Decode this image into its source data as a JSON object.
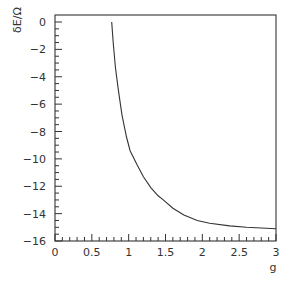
{
  "chart_data": {
    "type": "line",
    "title": "",
    "xlabel": "g",
    "ylabel": "δE/Ω",
    "xlim": [
      0,
      3
    ],
    "ylim": [
      -16,
      0.5
    ],
    "grid": false,
    "legend": null,
    "x_ticks": [
      0,
      0.5,
      1,
      1.5,
      2,
      2.5,
      3
    ],
    "x_tick_labels": [
      "0",
      "0.5",
      "1",
      "1.5",
      "2",
      "2.5",
      "3"
    ],
    "y_ticks": [
      0,
      -2,
      -4,
      -6,
      -8,
      -10,
      -12,
      -14,
      -16
    ],
    "y_tick_labels": [
      "0",
      "−2",
      "−4",
      "−6",
      "−8",
      "−10",
      "−12",
      "−14",
      "−16"
    ],
    "series": [
      {
        "name": "δE/Ω",
        "x": [
          0.77,
          0.79,
          0.82,
          0.86,
          0.91,
          0.97,
          1.02,
          1.11,
          1.2,
          1.3,
          1.4,
          1.47,
          1.6,
          1.75,
          1.93,
          2.1,
          2.37,
          2.6,
          2.8,
          3.0
        ],
        "y": [
          0.0,
          -1.5,
          -3.3,
          -5.0,
          -6.8,
          -8.4,
          -9.4,
          -10.4,
          -11.3,
          -12.1,
          -12.7,
          -13.0,
          -13.6,
          -14.1,
          -14.5,
          -14.7,
          -14.9,
          -15.0,
          -15.05,
          -15.1
        ]
      }
    ]
  },
  "axes": {
    "xlabel": "g",
    "ylabel": "δE/Ω"
  },
  "colors": {
    "line": "#333333",
    "axis": "#333333",
    "background": "#ffffff"
  }
}
